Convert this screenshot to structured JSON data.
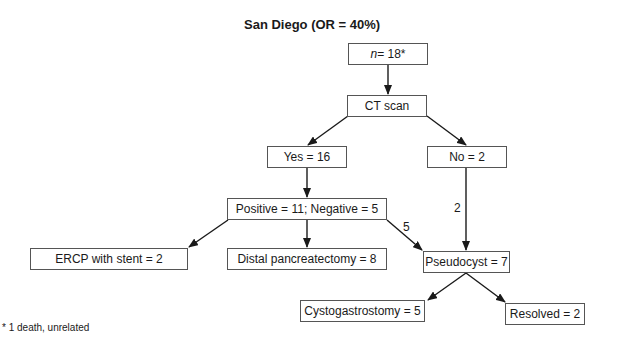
{
  "title": "San Diego (OR = 40%)",
  "nodes": {
    "n": {
      "prefix": "n",
      "text": " = 18*"
    },
    "ct": {
      "text": "CT scan"
    },
    "yes": {
      "text": "Yes = 16"
    },
    "no": {
      "text": "No = 2"
    },
    "posneg": {
      "text": "Positive = 11; Negative = 5"
    },
    "ercp": {
      "text": "ERCP with stent = 2"
    },
    "distal": {
      "text": "Distal pancreatectomy = 8"
    },
    "pseudo": {
      "text": "Pseudocyst = 7"
    },
    "cysto": {
      "text": "Cystogastrostomy = 5"
    },
    "resolved": {
      "text": "Resolved = 2"
    }
  },
  "edge_labels": {
    "neg_to_pseudo": "5",
    "no_to_pseudo": "2"
  },
  "footnote": "* 1 death, unrelated",
  "colors": {
    "line": "#1a1a1a",
    "border": "#555555"
  }
}
